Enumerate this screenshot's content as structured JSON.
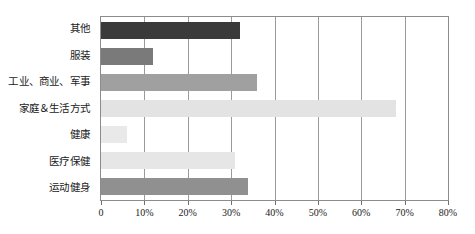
{
  "chart_data": {
    "type": "bar",
    "orientation": "horizontal",
    "title": "",
    "subtitle": "",
    "xlabel": "",
    "ylabel": "",
    "xlim": [
      0,
      80
    ],
    "xtick_labels": [
      "0",
      "10%",
      "20%",
      "30%",
      "40%",
      "50%",
      "60%",
      "70%",
      "80%"
    ],
    "xticks": [
      0,
      10,
      20,
      30,
      40,
      50,
      60,
      70,
      80
    ],
    "grid": true,
    "legend": "none",
    "unit": "%",
    "categories": [
      "其他",
      "服装",
      "工业、商业、军事",
      "家庭＆生活方式",
      "健康",
      "医疗保健",
      "运动健身"
    ],
    "values": [
      32,
      12,
      36,
      68,
      6,
      31,
      34
    ],
    "bars": [
      {
        "category": "其他",
        "value": 32,
        "color": "#3a3a3a"
      },
      {
        "category": "服装",
        "value": 12,
        "color": "#7a7a7a"
      },
      {
        "category": "工业、商业、军事",
        "value": 36,
        "color": "#a0a0a0"
      },
      {
        "category": "家庭＆生活方式",
        "value": 68,
        "color": "#e3e3e3"
      },
      {
        "category": "健康",
        "value": 6,
        "color": "#e9e9e9"
      },
      {
        "category": "医疗保健",
        "value": 31,
        "color": "#e6e6e6"
      },
      {
        "category": "运动健身",
        "value": 34,
        "color": "#909090"
      }
    ],
    "colors": {
      "plot_border": "#8c8c8c",
      "gridline": "#9a9a9a",
      "axis_text": "#1a1a1a",
      "background": "#ffffff"
    }
  }
}
